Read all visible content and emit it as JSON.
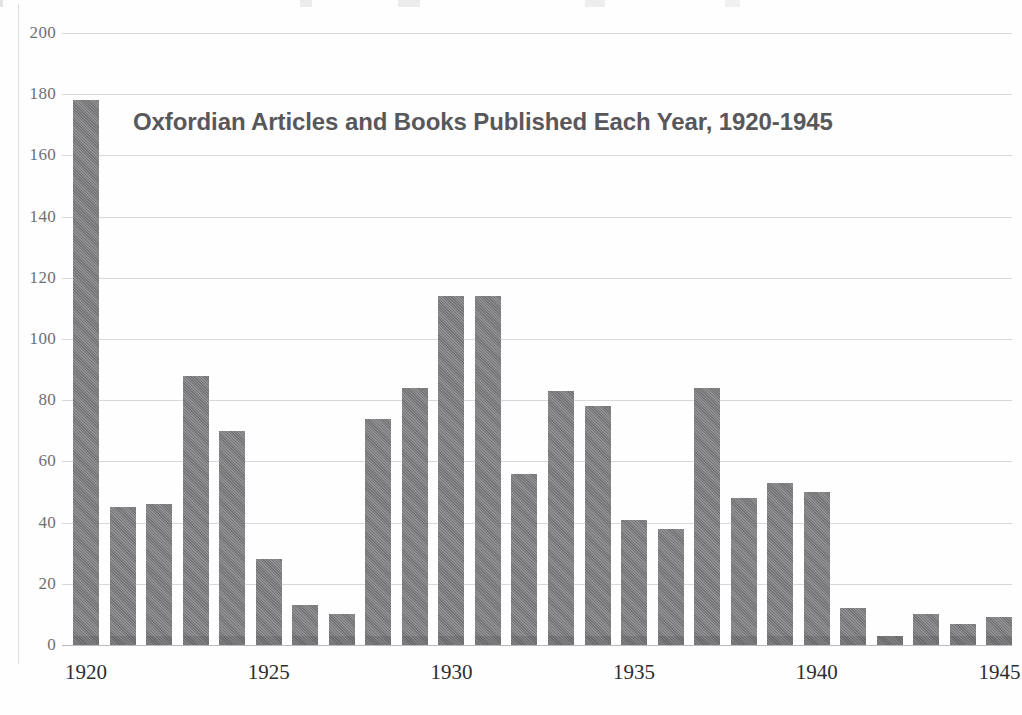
{
  "chart_data": {
    "type": "bar",
    "title": "Oxfordian Articles and Books Published Each Year, 1920-1945",
    "xlabel": "",
    "ylabel": "",
    "ylim": [
      0,
      200
    ],
    "ytick_values": [
      0,
      20,
      40,
      60,
      80,
      100,
      120,
      140,
      160,
      180,
      200
    ],
    "ytick_labels": [
      "0",
      "20",
      "40",
      "60",
      "80",
      "100",
      "120",
      "140",
      "160",
      "180",
      "200"
    ],
    "xtick_labels": [
      "1920",
      "1925",
      "1930",
      "1935",
      "1940",
      "1945"
    ],
    "grid": true,
    "legend": "none",
    "bar_color": "#7b7b7e",
    "categories": [
      "1920",
      "1921",
      "1922",
      "1923",
      "1924",
      "1925",
      "1926",
      "1927",
      "1928",
      "1929",
      "1930",
      "1931",
      "1932",
      "1933",
      "1934",
      "1935",
      "1936",
      "1937",
      "1938",
      "1939",
      "1940",
      "1941",
      "1942",
      "1943",
      "1944",
      "1945"
    ],
    "values": [
      178,
      45,
      46,
      88,
      70,
      28,
      13,
      10,
      74,
      84,
      114,
      114,
      56,
      83,
      78,
      41,
      38,
      84,
      48,
      53,
      50,
      12,
      3,
      10,
      7,
      9
    ]
  }
}
